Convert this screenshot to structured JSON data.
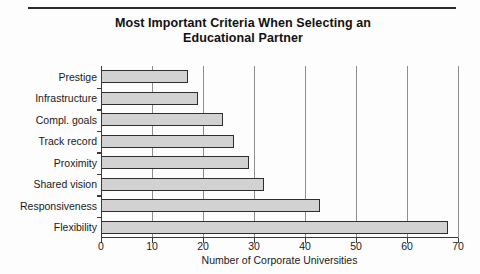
{
  "chart_data": {
    "type": "bar",
    "orientation": "horizontal",
    "title": "Most Important Criteria When Selecting an Educational Partner",
    "title_lines": [
      "Most Important Criteria When Selecting an",
      "Educational Partner"
    ],
    "categories": [
      "Prestige",
      "Infrastructure",
      "Compl. goals",
      "Track record",
      "Proximity",
      "Shared vision",
      "Responsiveness",
      "Flexibility"
    ],
    "values": [
      17,
      19,
      24,
      26,
      29,
      32,
      43,
      68
    ],
    "xlabel": "Number of Corporate Universities",
    "ylabel": "",
    "xlim": [
      0,
      70
    ],
    "xticks": [
      0,
      10,
      20,
      30,
      40,
      50,
      60,
      70
    ],
    "xtick_labels": [
      "0",
      "10",
      "20",
      "30",
      "40",
      "50",
      "60",
      "70"
    ],
    "grid": "vertical",
    "legend": null,
    "bar_fill_color": "#d2d2d2",
    "bar_edge_color": "#2e2e2e",
    "gridline_color": "#8d8d8d",
    "axis_color": "#3a3a3a",
    "text_color": "#1a1a1a"
  }
}
